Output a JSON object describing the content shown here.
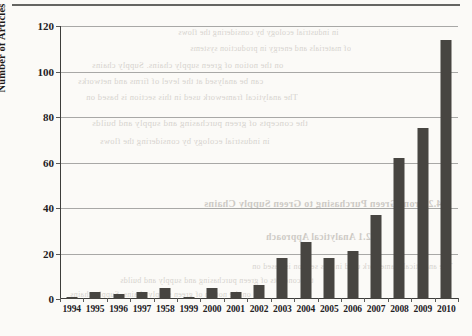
{
  "chart_data": {
    "type": "bar",
    "title": "",
    "xlabel": "",
    "ylabel": "Number of Articles",
    "categories": [
      "1994",
      "1995",
      "1996",
      "1997",
      "1958",
      "1999",
      "2000",
      "2001",
      "2002",
      "2003",
      "2004",
      "2005",
      "2006",
      "2007",
      "2008",
      "2009",
      "2010"
    ],
    "values": [
      1,
      3,
      2,
      3,
      5,
      1,
      5,
      3,
      6,
      18,
      25,
      18,
      21,
      37,
      62,
      75,
      114
    ],
    "ylim": [
      0,
      120
    ],
    "yticks": [
      0,
      20,
      40,
      60,
      80,
      100,
      120
    ],
    "ytick_labels": [
      "0",
      "20",
      "40",
      "60",
      "80",
      "100",
      "120"
    ],
    "grid": true,
    "legend": null,
    "bar_color": "#474541"
  },
  "scan_artifacts": {
    "top_rule": true,
    "bleed_through_lines": [
      "4.2 From Green Purchasing to Green Supply Chains",
      "4.2.1  Analytical Approach",
      "The analytical framework used in this section is based on",
      "the concepts of green purchasing and supply and builds",
      "on the notion of green supply chains. Supply chains",
      "can be analysed at the level of firms and networks",
      "in industrial ecology by considering the flows",
      "of materials and energy in production systems"
    ]
  }
}
